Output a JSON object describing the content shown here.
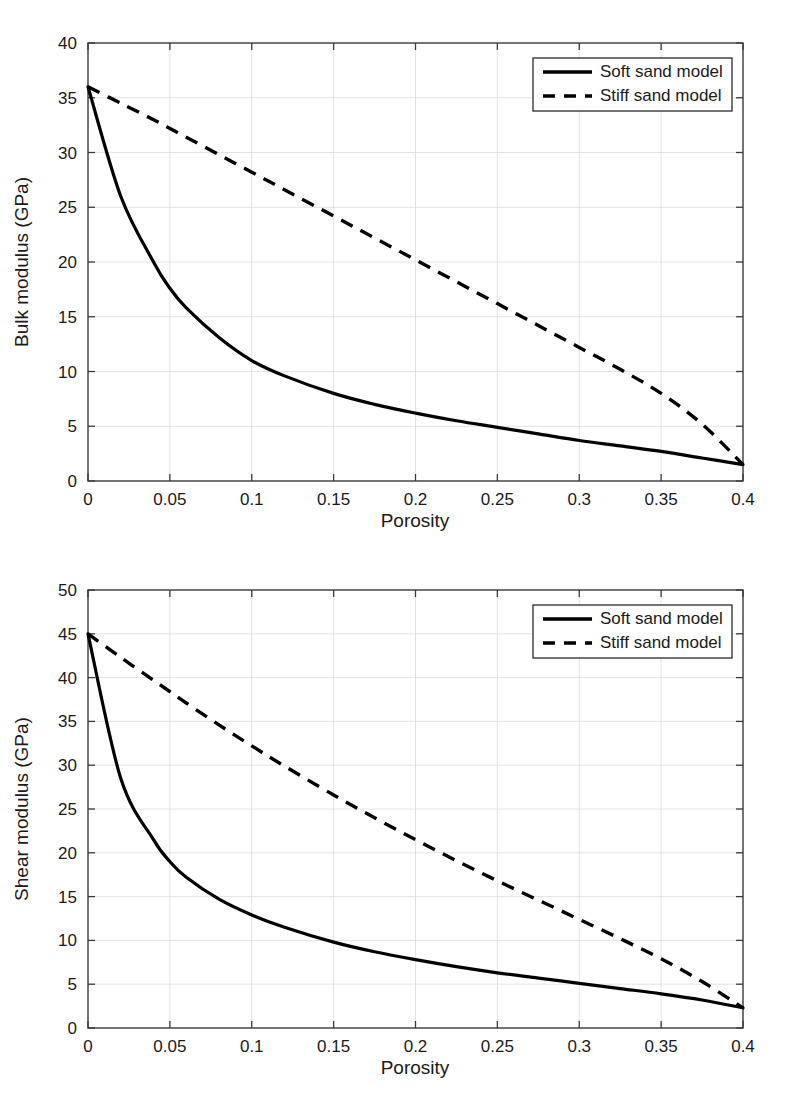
{
  "figures": [
    {
      "id": "bulk",
      "ylabel": "Bulk modulus (GPa)",
      "xlabel": "Porosity",
      "legend": {
        "soft_label": "Soft sand model",
        "stiff_label": "Stiff sand model"
      },
      "xticks": [
        "0",
        "0.05",
        "0.1",
        "0.15",
        "0.2",
        "0.25",
        "0.3",
        "0.35",
        "0.4"
      ],
      "yticks": [
        "0",
        "5",
        "10",
        "15",
        "20",
        "25",
        "30",
        "35",
        "40"
      ]
    },
    {
      "id": "shear",
      "ylabel": "Shear modulus (GPa)",
      "xlabel": "Porosity",
      "legend": {
        "soft_label": "Soft sand model",
        "stiff_label": "Stiff sand model"
      },
      "xticks": [
        "0",
        "0.05",
        "0.1",
        "0.15",
        "0.2",
        "0.25",
        "0.3",
        "0.35",
        "0.4"
      ],
      "yticks": [
        "0",
        "5",
        "10",
        "15",
        "20",
        "25",
        "30",
        "35",
        "40",
        "45",
        "50"
      ]
    }
  ],
  "colors": {
    "line": "#000000",
    "axis": "#3a3a3a",
    "grid": "#dcdcdc",
    "background": "#ffffff"
  },
  "chart_data": [
    {
      "type": "line",
      "title": "",
      "xlabel": "Porosity",
      "ylabel": "Bulk modulus (GPa)",
      "xlim": [
        0,
        0.4
      ],
      "ylim": [
        0,
        40
      ],
      "xticks": [
        0,
        0.05,
        0.1,
        0.15,
        0.2,
        0.25,
        0.3,
        0.35,
        0.4
      ],
      "yticks": [
        0,
        5,
        10,
        15,
        20,
        25,
        30,
        35,
        40
      ],
      "grid": true,
      "legend_position": "upper right",
      "x": [
        0,
        0.02,
        0.04,
        0.05,
        0.06,
        0.08,
        0.1,
        0.12,
        0.15,
        0.175,
        0.2,
        0.225,
        0.25,
        0.275,
        0.3,
        0.325,
        0.35,
        0.375,
        0.4
      ],
      "series": [
        {
          "name": "Soft sand model",
          "style": "solid",
          "values": [
            36.0,
            26.0,
            20.0,
            17.6,
            15.8,
            13.1,
            11.0,
            9.6,
            8.0,
            7.0,
            6.2,
            5.5,
            4.9,
            4.3,
            3.7,
            3.2,
            2.7,
            2.1,
            1.5
          ]
        },
        {
          "name": "Stiff sand model",
          "style": "dashed",
          "values": [
            36.0,
            34.5,
            33.0,
            32.2,
            31.4,
            29.8,
            28.2,
            26.6,
            24.2,
            22.2,
            20.2,
            18.2,
            16.2,
            14.2,
            12.2,
            10.2,
            8.0,
            5.2,
            1.5
          ]
        }
      ]
    },
    {
      "type": "line",
      "title": "",
      "xlabel": "Porosity",
      "ylabel": "Shear modulus (GPa)",
      "xlim": [
        0,
        0.4
      ],
      "ylim": [
        0,
        50
      ],
      "xticks": [
        0,
        0.05,
        0.1,
        0.15,
        0.2,
        0.25,
        0.3,
        0.35,
        0.4
      ],
      "yticks": [
        0,
        5,
        10,
        15,
        20,
        25,
        30,
        35,
        40,
        45,
        50
      ],
      "grid": true,
      "legend_position": "upper right",
      "x": [
        0,
        0.02,
        0.04,
        0.05,
        0.06,
        0.08,
        0.1,
        0.12,
        0.15,
        0.175,
        0.2,
        0.225,
        0.25,
        0.275,
        0.3,
        0.325,
        0.35,
        0.375,
        0.4
      ],
      "series": [
        {
          "name": "Soft sand model",
          "style": "solid",
          "values": [
            45.0,
            28.5,
            21.5,
            19.0,
            17.2,
            14.7,
            12.9,
            11.5,
            9.8,
            8.7,
            7.8,
            7.0,
            6.3,
            5.7,
            5.1,
            4.5,
            3.9,
            3.2,
            2.3
          ]
        },
        {
          "name": "Stiff sand model",
          "style": "dashed",
          "values": [
            45.0,
            42.3,
            39.7,
            38.4,
            37.1,
            34.6,
            32.2,
            29.9,
            26.6,
            24.0,
            21.5,
            19.1,
            16.8,
            14.6,
            12.4,
            10.2,
            7.9,
            5.3,
            2.3
          ]
        }
      ]
    }
  ]
}
